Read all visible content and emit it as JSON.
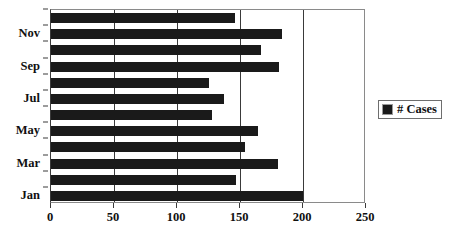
{
  "chart_data": {
    "type": "bar",
    "orientation": "horizontal",
    "title": "",
    "xlabel": "",
    "ylabel": "",
    "categories": [
      "Jan",
      "Feb",
      "Mar",
      "Apr",
      "May",
      "Jun",
      "Jul",
      "Aug",
      "Sep",
      "Oct",
      "Nov",
      "Dec"
    ],
    "values": [
      200,
      147,
      180,
      154,
      164,
      128,
      137,
      125,
      181,
      167,
      183,
      146
    ],
    "series": [
      {
        "name": "# Cases",
        "values": [
          200,
          147,
          180,
          154,
          164,
          128,
          137,
          125,
          181,
          167,
          183,
          146
        ],
        "color": "#1a1a1a"
      }
    ],
    "xlim": [
      0,
      250
    ],
    "x_ticks": [
      0,
      50,
      100,
      150,
      200,
      250
    ],
    "x_tick_labels": [
      "0",
      "50",
      "100",
      "150",
      "200",
      "250"
    ],
    "y_tick_labels": [
      "Jan",
      "Mar",
      "May",
      "Jul",
      "Sep",
      "Nov"
    ],
    "grid": "vertical",
    "legend_position": "right"
  },
  "legend": {
    "entries": [
      {
        "label": "# Cases",
        "color": "#1a1a1a"
      }
    ]
  },
  "colors": {
    "bar": "#1a1a1a",
    "gridline": "#3a3a3a",
    "plot_border": "#8a8a8a",
    "text": "#101010",
    "background": "#ffffff"
  }
}
